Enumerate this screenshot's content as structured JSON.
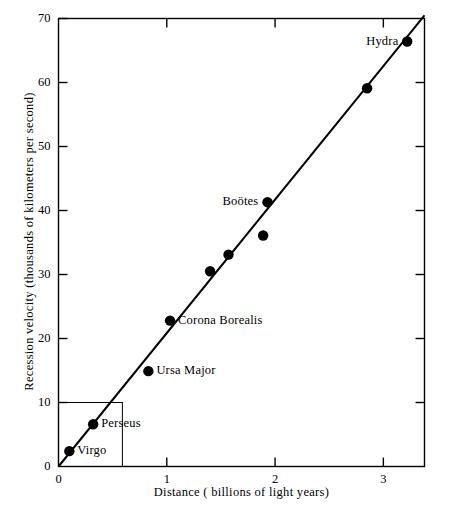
{
  "chart_data": {
    "type": "scatter",
    "title": "",
    "xlabel": "Distance ( billions of light years)",
    "ylabel": "Recession velocity (thousands of kilometers per second)",
    "xlim": [
      0,
      3.38
    ],
    "ylim": [
      0,
      70
    ],
    "xticks": [
      "0",
      "1",
      "2",
      "3"
    ],
    "xtick_values": [
      0,
      1,
      2,
      3
    ],
    "yticks": [
      "0",
      "10",
      "20",
      "30",
      "40",
      "50",
      "60",
      "70"
    ],
    "ytick_values": [
      0,
      10,
      20,
      30,
      40,
      50,
      60,
      70
    ],
    "grid": false,
    "legend": "none",
    "points": [
      {
        "label": "Virgo",
        "x": 0.1,
        "y": 2.4,
        "label_side": "right"
      },
      {
        "label": "Perseus",
        "x": 0.32,
        "y": 6.6,
        "label_side": "right"
      },
      {
        "label": "Ursa Major",
        "x": 0.83,
        "y": 14.9,
        "label_side": "right"
      },
      {
        "label": "Corona Borealis",
        "x": 1.03,
        "y": 22.8,
        "label_side": "right"
      },
      {
        "label": "",
        "x": 1.4,
        "y": 30.5,
        "label_side": "none"
      },
      {
        "label": "",
        "x": 1.57,
        "y": 33.1,
        "label_side": "none"
      },
      {
        "label": "",
        "x": 1.89,
        "y": 36.1,
        "label_side": "none"
      },
      {
        "label": "Boötes",
        "x": 1.93,
        "y": 41.3,
        "label_side": "left"
      },
      {
        "label": "",
        "x": 2.85,
        "y": 59.1,
        "label_side": "none"
      },
      {
        "label": "Hydra",
        "x": 3.22,
        "y": 66.4,
        "label_side": "left"
      }
    ],
    "fit_line": {
      "x0": 0,
      "y0": 0,
      "x1": 3.38,
      "y1": 70.5
    },
    "inset_box": {
      "x0": 0,
      "y0": 0,
      "x1": 0.59,
      "y1": 10
    },
    "point_color": "#000000",
    "line_color": "#000000",
    "axis_color": "#000000",
    "background_color": "#ffffff"
  }
}
